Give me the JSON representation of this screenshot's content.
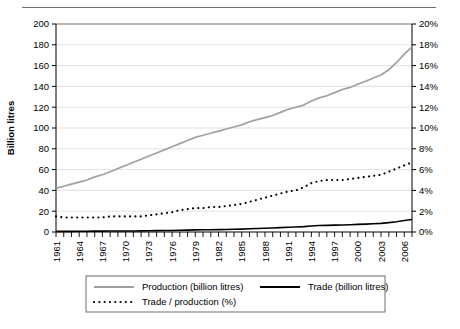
{
  "chart_data": {
    "type": "line",
    "title": "",
    "xlabel": "",
    "ylabel": "Billion litres",
    "y2label": "",
    "xlim": [
      1961,
      2007
    ],
    "ylim": [
      0,
      200
    ],
    "y2lim": [
      0,
      20
    ],
    "grid": true,
    "legend_position": "bottom",
    "y_ticks": [
      0,
      20,
      40,
      60,
      80,
      100,
      120,
      140,
      160,
      180,
      200
    ],
    "y_tick_labels": [
      "0",
      "20",
      "40",
      "60",
      "80",
      "100",
      "120",
      "140",
      "160",
      "180",
      "200"
    ],
    "y2_ticks": [
      0,
      2,
      4,
      6,
      8,
      10,
      12,
      14,
      16,
      18,
      20
    ],
    "y2_tick_labels": [
      "0%",
      "2%",
      "4%",
      "6%",
      "8%",
      "10%",
      "12%",
      "14%",
      "16%",
      "18%",
      "20%"
    ],
    "x_tick_labels": [
      "1961",
      "1964",
      "1967",
      "1970",
      "1973",
      "1976",
      "1979",
      "1982",
      "1985",
      "1988",
      "1991",
      "1994",
      "1997",
      "2000",
      "2003",
      "2006"
    ],
    "x_tick_values": [
      1961,
      1964,
      1967,
      1970,
      1973,
      1976,
      1979,
      1982,
      1985,
      1988,
      1991,
      1994,
      1997,
      2000,
      2003,
      2006
    ],
    "x": [
      1961,
      1962,
      1963,
      1964,
      1965,
      1966,
      1967,
      1968,
      1969,
      1970,
      1971,
      1972,
      1973,
      1974,
      1975,
      1976,
      1977,
      1978,
      1979,
      1980,
      1981,
      1982,
      1983,
      1984,
      1985,
      1986,
      1987,
      1988,
      1989,
      1990,
      1991,
      1992,
      1993,
      1994,
      1995,
      1996,
      1997,
      1998,
      1999,
      2000,
      2001,
      2002,
      2003,
      2004,
      2005,
      2006,
      2007
    ],
    "series": [
      {
        "name": "Production (billion litres)",
        "axis": "left",
        "color": "#a0a0a0",
        "style": "solid",
        "values": [
          42,
          44,
          46,
          48,
          50,
          53,
          55,
          58,
          61,
          64,
          67,
          70,
          73,
          76,
          79,
          82,
          85,
          88,
          91,
          93,
          95,
          97,
          99,
          101,
          103,
          106,
          108,
          110,
          112,
          115,
          118,
          120,
          122,
          126,
          129,
          131,
          134,
          137,
          139,
          142,
          145,
          148,
          151,
          156,
          163,
          171,
          178
        ]
      },
      {
        "name": "Trade (billion litres)",
        "axis": "left",
        "color": "#000000",
        "style": "solid",
        "values": [
          0.6,
          0.6,
          0.6,
          0.7,
          0.7,
          0.8,
          0.8,
          0.9,
          0.9,
          1.0,
          1.0,
          1.1,
          1.2,
          1.3,
          1.4,
          1.5,
          1.7,
          1.8,
          2.0,
          2.1,
          2.2,
          2.3,
          2.4,
          2.6,
          2.8,
          3.1,
          3.4,
          3.6,
          3.9,
          4.2,
          4.5,
          4.8,
          5.2,
          5.8,
          6.2,
          6.4,
          6.6,
          6.8,
          7.0,
          7.3,
          7.6,
          7.9,
          8.3,
          9.0,
          9.9,
          11.0,
          12.0
        ]
      },
      {
        "name": "Trade / production (%)",
        "axis": "right",
        "color": "#000000",
        "style": "dotted",
        "values": [
          1.5,
          1.4,
          1.4,
          1.4,
          1.4,
          1.4,
          1.4,
          1.5,
          1.5,
          1.5,
          1.5,
          1.5,
          1.6,
          1.7,
          1.8,
          1.9,
          2.1,
          2.2,
          2.3,
          2.3,
          2.4,
          2.4,
          2.5,
          2.6,
          2.7,
          2.9,
          3.1,
          3.3,
          3.5,
          3.7,
          3.9,
          4.0,
          4.3,
          4.7,
          4.9,
          5.0,
          5.0,
          5.0,
          5.1,
          5.2,
          5.3,
          5.4,
          5.5,
          5.8,
          6.1,
          6.4,
          6.7
        ]
      }
    ]
  },
  "legend": {
    "items": [
      {
        "label": "Production (billion litres)",
        "color": "#a0a0a0",
        "style": "solid"
      },
      {
        "label": "Trade (billion litres)",
        "color": "#000000",
        "style": "solid"
      },
      {
        "label": "Trade / production (%)",
        "color": "#000000",
        "style": "dotted"
      }
    ]
  }
}
